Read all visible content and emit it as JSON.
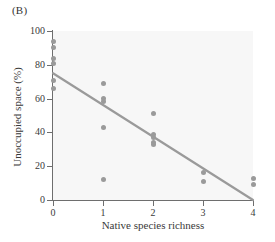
{
  "figure": {
    "panel_label": "(B)",
    "background_color": "#ffffff",
    "plot_background_color": "#f7f7f7",
    "axis_color": "#6e6e6e",
    "point_color": "#9a9a9a",
    "line_color": "#9a9a9a"
  },
  "chart_data": {
    "type": "scatter",
    "title": "(B)",
    "xlabel": "Native species richness",
    "ylabel": "Unoccupied space (%)",
    "xlim": [
      0,
      4
    ],
    "ylim": [
      0,
      100
    ],
    "xticks": [
      0,
      1,
      2,
      3,
      4
    ],
    "yticks": [
      0,
      20,
      40,
      60,
      80,
      100
    ],
    "xtick_labels": [
      "0",
      "1",
      "2",
      "3",
      "4"
    ],
    "ytick_labels": [
      "0",
      "20",
      "40",
      "60",
      "80",
      "100"
    ],
    "grid": false,
    "legend": null,
    "points": [
      {
        "x": 0,
        "y": 94
      },
      {
        "x": 0,
        "y": 90
      },
      {
        "x": 0,
        "y": 84
      },
      {
        "x": 0,
        "y": 81
      },
      {
        "x": 0,
        "y": 71
      },
      {
        "x": 0,
        "y": 66
      },
      {
        "x": 1,
        "y": 69
      },
      {
        "x": 1,
        "y": 60
      },
      {
        "x": 1,
        "y": 58
      },
      {
        "x": 1,
        "y": 43
      },
      {
        "x": 1,
        "y": 12
      },
      {
        "x": 2,
        "y": 51
      },
      {
        "x": 2,
        "y": 39
      },
      {
        "x": 2,
        "y": 37
      },
      {
        "x": 2,
        "y": 34
      },
      {
        "x": 2,
        "y": 33
      },
      {
        "x": 3,
        "y": 16
      },
      {
        "x": 3,
        "y": 11
      },
      {
        "x": 4,
        "y": 13
      },
      {
        "x": 4,
        "y": 9
      }
    ],
    "trendline": {
      "type": "linear",
      "x_start": 0,
      "y_start": 75,
      "x_end": 4,
      "y_end": 0
    }
  }
}
